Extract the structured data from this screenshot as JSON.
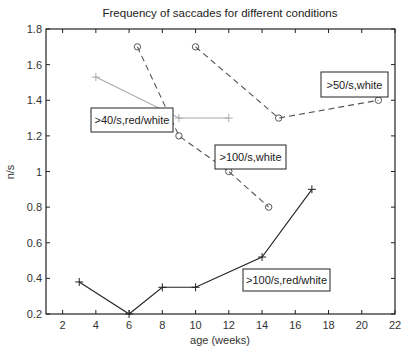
{
  "chart_data": {
    "type": "line",
    "title": "Frequency of saccades for different conditions",
    "xlabel": "age (weeks)",
    "ylabel": "n/s",
    "xlim": [
      1,
      22
    ],
    "ylim": [
      0.2,
      1.8
    ],
    "xticks": [
      2,
      4,
      6,
      8,
      10,
      12,
      14,
      16,
      18,
      20,
      22
    ],
    "yticks": [
      0.2,
      0.4,
      0.6,
      0.8,
      1,
      1.2,
      1.4,
      1.6,
      1.8
    ],
    "ytick_labels": [
      "0.2",
      "0.4",
      "0.6",
      "0.8",
      "1",
      "1.2",
      "1.4",
      "1.6",
      "1.8"
    ],
    "grid": false,
    "legend": "inline text boxes",
    "series": [
      {
        "name": ">40/s,red/white",
        "color": "#aaaaaa",
        "line_style": "solid",
        "marker": "+",
        "x": [
          4,
          9,
          12
        ],
        "y": [
          1.53,
          1.3,
          1.3
        ],
        "label_box": {
          "x": 91,
          "y": 108,
          "w": 82,
          "h": 24
        }
      },
      {
        "name": ">100/s,white",
        "color": "#555555",
        "line_style": "dashed",
        "marker": "o",
        "x": [
          6.5,
          9,
          12,
          14.4
        ],
        "y": [
          1.7,
          1.2,
          1.0,
          0.8
        ],
        "label_box": {
          "x": 215,
          "y": 145,
          "w": 71,
          "h": 24
        }
      },
      {
        "name": ">50/s,white",
        "color": "#555555",
        "line_style": "dashed",
        "marker": "o",
        "x": [
          10,
          15,
          21
        ],
        "y": [
          1.7,
          1.3,
          1.4
        ],
        "label_box": {
          "x": 321,
          "y": 72,
          "w": 67,
          "h": 25
        }
      },
      {
        "name": ">100/s,red/white",
        "color": "#222222",
        "line_style": "solid",
        "marker": "+",
        "x": [
          3,
          6,
          8,
          10,
          14,
          17
        ],
        "y": [
          0.38,
          0.2,
          0.35,
          0.35,
          0.52,
          0.9
        ],
        "label_box": {
          "x": 243,
          "y": 269,
          "w": 87,
          "h": 22
        }
      }
    ]
  }
}
